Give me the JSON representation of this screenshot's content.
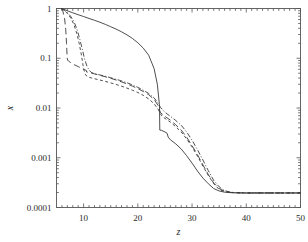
{
  "chart_data": {
    "type": "line",
    "title": "",
    "xlabel": "z",
    "ylabel": "x",
    "xscale": "linear",
    "yscale": "log",
    "xlim": [
      5,
      50
    ],
    "ylim": [
      0.0001,
      1
    ],
    "grid": false,
    "legend": null,
    "xticks": [
      10,
      20,
      30,
      40,
      50
    ],
    "xtick_labels": [
      "10",
      "20",
      "30",
      "40",
      "50"
    ],
    "yticks": [
      1,
      0.1,
      0.01,
      0.001,
      0.0001
    ],
    "ytick_labels": [
      "1",
      "0.1",
      "0.01",
      "0.001",
      "0.0001"
    ],
    "background": "#ffffff",
    "line_color": "#3a3a3a",
    "axis_color": "#555555",
    "series": [
      {
        "name": "solid",
        "style": "solid",
        "dasharray": "",
        "x": [
          5.9,
          6.3,
          7.0,
          8.0,
          9.0,
          10.0,
          11.0,
          12.0,
          13.0,
          14.0,
          15.0,
          16.0,
          17.0,
          18.0,
          19.0,
          20.0,
          21.0,
          22.0,
          23.0,
          23.6,
          23.95,
          24.0,
          24.05,
          24.4,
          25.0,
          25.4,
          25.6,
          26.0,
          27.0,
          28.0,
          29.0,
          30.0,
          31.0,
          32.0,
          33.0,
          34.0,
          35.0,
          36.0,
          37.0,
          38.0,
          40.0,
          44.0,
          50.0
        ],
        "y": [
          1.0,
          0.97,
          0.9,
          0.82,
          0.75,
          0.69,
          0.63,
          0.58,
          0.53,
          0.48,
          0.43,
          0.385,
          0.34,
          0.295,
          0.25,
          0.205,
          0.16,
          0.115,
          0.062,
          0.03,
          0.0125,
          0.0105,
          0.0036,
          0.00355,
          0.0033,
          0.0031,
          0.0026,
          0.0023,
          0.0019,
          0.0015,
          0.0011,
          0.00078,
          0.00054,
          0.00039,
          0.0003,
          0.00024,
          0.000215,
          0.000203,
          0.000199,
          0.000197,
          0.000196,
          0.000196,
          0.000196
        ]
      },
      {
        "name": "long-dash",
        "style": "long-dashed",
        "dasharray": "6.5 3.5",
        "x": [
          5.9,
          6.2,
          6.5,
          6.7,
          6.85,
          6.95,
          7.0,
          7.05,
          7.2,
          7.6,
          8.3,
          9.0,
          10.0,
          10.5,
          10.55,
          11.0,
          12.0,
          13.0,
          14.0,
          15.0,
          16.0,
          17.0,
          18.0,
          19.0,
          20.0,
          21.0,
          22.0,
          23.0,
          23.8,
          24.0,
          24.2,
          25.0,
          26.0,
          27.0,
          28.0,
          29.0,
          30.0,
          31.0,
          32.0,
          33.0,
          34.0,
          35.0,
          36.0,
          37.0,
          38.0,
          40.0,
          44.0,
          50.0
        ],
        "y": [
          1.0,
          0.86,
          0.62,
          0.38,
          0.2,
          0.115,
          0.097,
          0.092,
          0.088,
          0.082,
          0.074,
          0.068,
          0.06,
          0.057,
          0.053,
          0.052,
          0.0485,
          0.0455,
          0.0425,
          0.0395,
          0.0365,
          0.0335,
          0.0305,
          0.0275,
          0.0245,
          0.0215,
          0.0185,
          0.0148,
          0.011,
          0.009,
          0.008,
          0.0068,
          0.0057,
          0.0046,
          0.0036,
          0.0026,
          0.00175,
          0.00115,
          0.00072,
          0.00046,
          0.00031,
          0.00024,
          0.000212,
          0.000202,
          0.000198,
          0.000196,
          0.000196,
          0.000196
        ]
      },
      {
        "name": "short-dash",
        "style": "short-dashed",
        "dasharray": "3 2.5",
        "x": [
          5.9,
          6.4,
          7.0,
          7.6,
          8.2,
          8.8,
          9.2,
          9.6,
          9.9,
          10.1,
          10.3,
          10.6,
          11.0,
          11.5,
          12.0,
          13.0,
          14.0,
          15.0,
          16.0,
          17.0,
          18.0,
          19.0,
          20.0,
          21.0,
          22.0,
          23.0,
          23.8,
          24.1,
          24.6,
          25.2,
          26.0,
          27.0,
          28.0,
          29.0,
          30.0,
          31.0,
          32.0,
          33.0,
          34.0,
          35.0,
          36.0,
          37.0,
          38.0,
          40.0,
          44.0,
          50.0
        ],
        "y": [
          1.0,
          0.92,
          0.8,
          0.65,
          0.48,
          0.3,
          0.195,
          0.115,
          0.072,
          0.056,
          0.048,
          0.0435,
          0.0415,
          0.04,
          0.0388,
          0.0365,
          0.0343,
          0.032,
          0.0297,
          0.0274,
          0.0251,
          0.0228,
          0.0205,
          0.018,
          0.0152,
          0.0122,
          0.0092,
          0.0078,
          0.0066,
          0.006,
          0.0052,
          0.0042,
          0.0033,
          0.0024,
          0.00165,
          0.00108,
          0.00068,
          0.00044,
          0.0003,
          0.00023,
          0.000209,
          0.000201,
          0.000198,
          0.000196,
          0.000196,
          0.000196
        ]
      },
      {
        "name": "dash-dot",
        "style": "dash-dot",
        "dasharray": "5 2 1 2",
        "x": [
          5.9,
          6.4,
          7.0,
          7.6,
          8.2,
          8.8,
          9.3,
          9.8,
          10.2,
          10.6,
          11.0,
          11.4,
          12.0,
          13.0,
          14.0,
          15.0,
          16.0,
          17.0,
          18.0,
          19.0,
          20.0,
          21.0,
          22.0,
          23.0,
          23.8,
          24.2,
          24.8,
          25.4,
          26.0,
          27.0,
          28.0,
          29.0,
          30.0,
          31.0,
          32.0,
          33.0,
          34.0,
          35.0,
          36.0,
          37.0,
          38.0,
          40.0,
          44.0,
          50.0
        ],
        "y": [
          1.0,
          0.93,
          0.83,
          0.7,
          0.55,
          0.38,
          0.24,
          0.145,
          0.095,
          0.07,
          0.058,
          0.052,
          0.049,
          0.0462,
          0.0434,
          0.0406,
          0.0378,
          0.035,
          0.0322,
          0.0292,
          0.026,
          0.0228,
          0.0196,
          0.016,
          0.0122,
          0.0102,
          0.0086,
          0.0076,
          0.0068,
          0.0056,
          0.0045,
          0.0033,
          0.00225,
          0.00145,
          0.0009,
          0.00055,
          0.00035,
          0.00026,
          0.000218,
          0.000204,
          0.000199,
          0.000196,
          0.000196,
          0.000196
        ]
      }
    ]
  }
}
